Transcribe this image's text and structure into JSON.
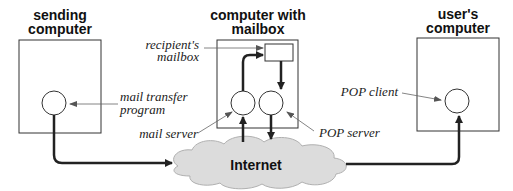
{
  "nodes": {
    "sending": {
      "title_line1": "sending",
      "title_line2": "computer"
    },
    "mailbox_host": {
      "title_line1": "computer with",
      "title_line2": "mailbox"
    },
    "user": {
      "title_line1": "user's",
      "title_line2": "computer"
    },
    "internet": {
      "label": "Internet"
    }
  },
  "labels": {
    "recipient_line1": "recipient's",
    "recipient_line2": "mailbox",
    "mtp_line1": "mail transfer",
    "mtp_line2": "program",
    "mail_server": "mail server",
    "pop_server": "POP server",
    "pop_client": "POP client"
  },
  "colors": {
    "stroke": "#222222",
    "cloud_fill": "#dcdcdc",
    "cloud_stroke": "#b0b0b0",
    "pointer": "#666666"
  }
}
